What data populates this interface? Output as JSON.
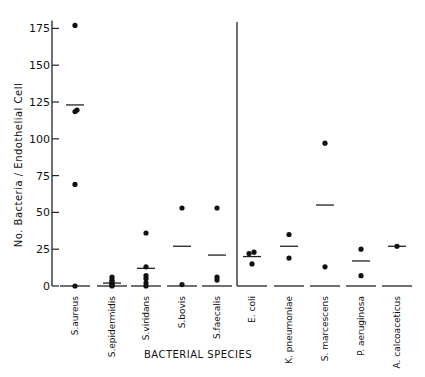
{
  "chart_data": {
    "type": "scatter",
    "title": "",
    "xlabel": "BACTERIAL SPECIES",
    "ylabel": "No. Bacteria / Endothelial Cell",
    "ylim": [
      0,
      175
    ],
    "yticks": [
      0,
      25,
      50,
      75,
      100,
      125,
      150,
      175
    ],
    "grid": false,
    "legend": null,
    "annotations": [
      "Vertical divider separating gram-positive species (left) from gram-negative species (right)"
    ],
    "categories": [
      "S.aureus",
      "S.epidermidis",
      "S.viridans",
      "S.bovis",
      "S.faecalis",
      "E. coli",
      "K. pneumoniae",
      "S. marcescens",
      "P. aeruginosa",
      "A. calcoaceticus"
    ],
    "series": [
      {
        "name": "S.aureus",
        "points": [
          177,
          119.5,
          118.5,
          69,
          0
        ],
        "mean": 123
      },
      {
        "name": "S.epidermidis",
        "points": [
          6,
          4,
          3,
          2,
          1,
          0.5,
          0
        ],
        "mean": 2
      },
      {
        "name": "S.viridans",
        "points": [
          36,
          13,
          7,
          5,
          2,
          0
        ],
        "mean": 12
      },
      {
        "name": "S.bovis",
        "points": [
          53,
          1
        ],
        "mean": 27
      },
      {
        "name": "S.faecalis",
        "points": [
          53,
          6,
          4
        ],
        "mean": 21
      },
      {
        "name": "E. coli",
        "points": [
          23,
          22,
          15
        ],
        "mean": 20
      },
      {
        "name": "K. pneumoniae",
        "points": [
          35,
          19
        ],
        "mean": 27
      },
      {
        "name": "S. marcescens",
        "points": [
          97,
          13
        ],
        "mean": 55
      },
      {
        "name": "P. aeruginosa",
        "points": [
          25,
          7
        ],
        "mean": 17
      },
      {
        "name": "A. calcoaceticus",
        "points": [
          27
        ],
        "mean": 27
      }
    ]
  },
  "axis": {
    "y_title": "No. Bacteria / Endothelial Cell",
    "x_title": "BACTERIAL SPECIES"
  }
}
